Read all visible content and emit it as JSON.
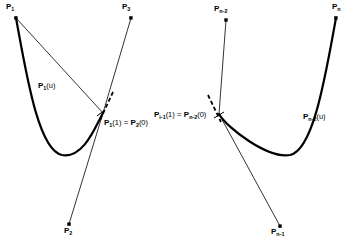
{
  "figure": {
    "kind": "spline-continuity-diagram",
    "background": "#ffffff",
    "stroke_color": "#000000"
  },
  "labels": {
    "p1": {
      "base": "P",
      "sub": "1"
    },
    "p2": {
      "base": "P",
      "sub": "2"
    },
    "p3": {
      "base": "P",
      "sub": "3"
    },
    "p1_of_u": {
      "base": "P",
      "sub": "1",
      "arg": "(u)"
    },
    "pn_minus_2": {
      "base": "P",
      "sub": "n-2"
    },
    "pn_minus_1": {
      "base": "P",
      "sub": "n-1"
    },
    "pn": {
      "base": "P",
      "sub": "n"
    },
    "pn_minus_2_of_u": {
      "base": "P",
      "sub": "n-2",
      "arg": "(u)"
    }
  },
  "equations": {
    "left": {
      "lhs_base": "P",
      "lhs_sub": "1",
      "lhs_arg": "(1)",
      "operator": "=",
      "rhs_base": "P",
      "rhs_sub": "2",
      "rhs_arg": "(0)"
    },
    "right": {
      "lhs_base": "P",
      "lhs_sub": "i-1",
      "lhs_arg": "(1)",
      "operator": "=",
      "rhs_base": "P",
      "rhs_sub": "n-2",
      "rhs_arg": "(0)"
    }
  },
  "geometry": {
    "left_curve_path": "M 16 18 C 26 72, 38 150, 62 155 C 84 159, 96 125, 103 113",
    "left_polygon_path": "M 16 18 L 103 113 L 131 18",
    "left_leg_path": "M 103 113 L 69 224",
    "left_dash_path": "M 112 94 L 99 121",
    "right_curve_path": "M 336 18 C 326 72, 314 150, 290 155 C 268 159, 227 128, 219 114",
    "right_leg_up_path": "M 219 114 L 226 20",
    "right_leg_down_path": "M 219 114 L 280 226",
    "right_dash_path": "M 208 96 L 221 122",
    "points": [
      {
        "name": "P1",
        "x": 16,
        "y": 18
      },
      {
        "name": "P3",
        "x": 131,
        "y": 18
      },
      {
        "name": "P2",
        "x": 69,
        "y": 224
      },
      {
        "name": "Pn-2",
        "x": 226,
        "y": 20
      },
      {
        "name": "Pn",
        "x": 336,
        "y": 18
      },
      {
        "name": "Pn-1",
        "x": 280,
        "y": 226
      },
      {
        "name": "junction-left",
        "x": 103,
        "y": 113
      },
      {
        "name": "junction-right",
        "x": 219,
        "y": 114
      }
    ]
  }
}
